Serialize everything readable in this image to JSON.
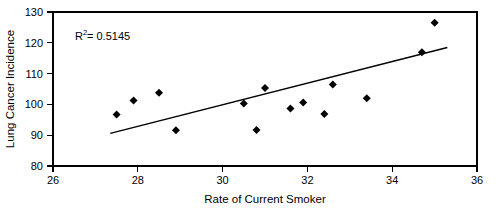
{
  "chart_data": {
    "type": "scatter",
    "title": "",
    "xlabel": "Rate of Current Smoker",
    "ylabel": "Lung Cancer Incidence",
    "xlim": [
      26,
      36
    ],
    "ylim": [
      80,
      130
    ],
    "xticks": [
      26,
      28,
      30,
      32,
      34,
      36
    ],
    "yticks": [
      80,
      90,
      100,
      110,
      120,
      130
    ],
    "xtick_labels": [
      "26",
      "28",
      "30",
      "32",
      "34",
      "36"
    ],
    "ytick_labels": [
      "80",
      "90",
      "100",
      "110",
      "120",
      "130"
    ],
    "grid": false,
    "legend": false,
    "marker_shape": "diamond",
    "marker_color": "#000000",
    "points": [
      {
        "x": 27.5,
        "y": 96.7
      },
      {
        "x": 27.9,
        "y": 101.3
      },
      {
        "x": 28.5,
        "y": 103.8
      },
      {
        "x": 28.9,
        "y": 91.6
      },
      {
        "x": 30.5,
        "y": 100.3
      },
      {
        "x": 30.8,
        "y": 91.7
      },
      {
        "x": 31.0,
        "y": 105.3
      },
      {
        "x": 31.6,
        "y": 98.7
      },
      {
        "x": 31.9,
        "y": 100.6
      },
      {
        "x": 32.4,
        "y": 96.9
      },
      {
        "x": 32.6,
        "y": 106.5
      },
      {
        "x": 33.4,
        "y": 102.0
      },
      {
        "x": 34.7,
        "y": 116.9
      },
      {
        "x": 35.0,
        "y": 126.5
      }
    ],
    "trendline": {
      "type": "linear",
      "x_start": 27.35,
      "y_start": 90.6,
      "x_end": 35.3,
      "y_end": 118.5
    },
    "annotations": [
      {
        "name": "r-squared",
        "prefix": "R",
        "superscript": "2",
        "suffix": " = 0.5145",
        "full_text": "R2 = 0.5145",
        "x_px": 75,
        "y_px": 38
      }
    ]
  }
}
